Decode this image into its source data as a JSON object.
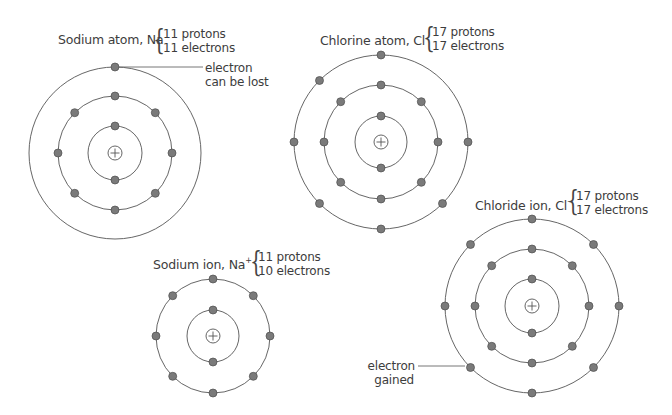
{
  "colors": {
    "shell_stroke": "#555555",
    "electron_fill": "#7a7a7a",
    "electron_stroke": "#4d4d4d",
    "nucleus_stroke": "#555555",
    "text": "#3d3d3d",
    "background": "#ffffff"
  },
  "atoms": [
    {
      "id": "sodium-atom",
      "title": "Sodium atom, Na",
      "charge": "",
      "protons": "11 protons",
      "electrons": "11 electrons",
      "center": [
        115,
        153
      ],
      "shells": [
        {
          "radius": 27,
          "electron_angles": [
            90,
            270
          ]
        },
        {
          "radius": 57,
          "electron_angles": [
            0,
            45,
            90,
            135,
            180,
            225,
            270,
            315
          ]
        },
        {
          "radius": 86,
          "electron_angles": [
            90
          ]
        }
      ],
      "callout": {
        "line1": "electron",
        "line2": "can be lost"
      }
    },
    {
      "id": "chlorine-atom",
      "title": "Chlorine atom, Cl",
      "charge": "",
      "protons": "17 protons",
      "electrons": "17 electrons",
      "center": [
        381,
        142
      ],
      "shells": [
        {
          "radius": 26,
          "electron_angles": [
            90,
            270
          ]
        },
        {
          "radius": 57,
          "electron_angles": [
            0,
            45,
            90,
            135,
            180,
            225,
            270,
            315
          ]
        },
        {
          "radius": 87,
          "electron_angles": [
            90,
            135,
            180,
            225,
            270,
            315,
            0
          ]
        }
      ]
    },
    {
      "id": "sodium-ion",
      "title": "Sodium ion, Na",
      "charge": "+",
      "protons": "11 protons",
      "electrons": "10 electrons",
      "center": [
        213,
        336
      ],
      "shells": [
        {
          "radius": 26,
          "electron_angles": [
            90,
            270
          ]
        },
        {
          "radius": 57,
          "electron_angles": [
            0,
            45,
            90,
            135,
            180,
            225,
            270,
            315
          ]
        }
      ]
    },
    {
      "id": "chloride-ion",
      "title": "Chloride ion, Cl",
      "charge": "−",
      "protons": "17 protons",
      "electrons": "17 electrons",
      "center": [
        532,
        306
      ],
      "shells": [
        {
          "radius": 27,
          "electron_angles": [
            90,
            270
          ]
        },
        {
          "radius": 57,
          "electron_angles": [
            0,
            45,
            90,
            135,
            180,
            225,
            270,
            315
          ]
        },
        {
          "radius": 87,
          "electron_angles": [
            0,
            45,
            90,
            135,
            180,
            225,
            270,
            315
          ]
        }
      ],
      "callout": {
        "line1": "electron",
        "line2": "gained"
      }
    }
  ],
  "brace_glyph": "{"
}
